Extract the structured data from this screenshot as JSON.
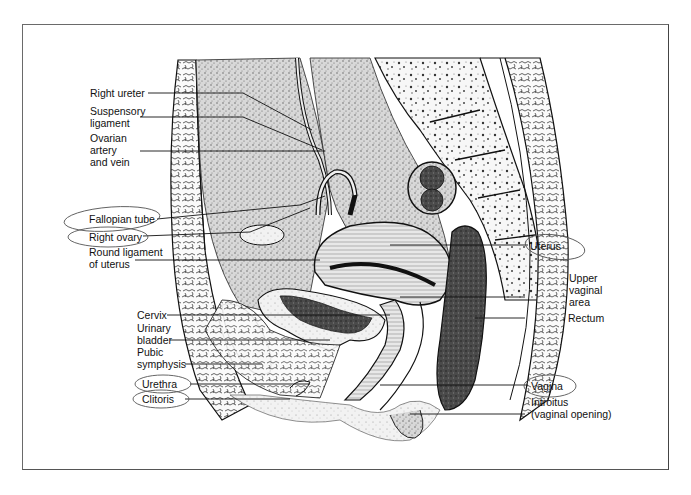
{
  "diagram": {
    "type": "anatomical sagittal section",
    "colors": {
      "ink": "#111111",
      "frame": "#6a6a6a",
      "paper": "#ffffff",
      "annotation_circle": "#555555"
    }
  },
  "labels_left": [
    {
      "id": "right-ureter",
      "lines": [
        "Right ureter"
      ],
      "circled": false
    },
    {
      "id": "suspensory-ligament",
      "lines": [
        "Suspensory",
        "ligament"
      ],
      "circled": false
    },
    {
      "id": "ovarian-artery-vein",
      "lines": [
        "Ovarian",
        "artery",
        "and vein"
      ],
      "circled": false
    },
    {
      "id": "fallopian-tube",
      "lines": [
        "Fallopian tube"
      ],
      "circled": true
    },
    {
      "id": "right-ovary",
      "lines": [
        "Right ovary"
      ],
      "circled": true
    },
    {
      "id": "round-ligament",
      "lines": [
        "Round ligament",
        "of uterus"
      ],
      "circled": false
    },
    {
      "id": "cervix",
      "lines": [
        "Cervix"
      ],
      "circled": false
    },
    {
      "id": "urinary-bladder",
      "lines": [
        "Urinary",
        "bladder"
      ],
      "circled": false
    },
    {
      "id": "pubic-symphysis",
      "lines": [
        "Pubic",
        "symphysis"
      ],
      "circled": false
    },
    {
      "id": "urethra",
      "lines": [
        "Urethra"
      ],
      "circled": true
    },
    {
      "id": "clitoris",
      "lines": [
        "Clitoris"
      ],
      "circled": true
    }
  ],
  "labels_right": [
    {
      "id": "uterus",
      "lines": [
        "Uterus"
      ],
      "circled": true
    },
    {
      "id": "upper-vaginal-area",
      "lines": [
        "Upper",
        "vaginal",
        "area"
      ],
      "circled": false
    },
    {
      "id": "rectum",
      "lines": [
        "Rectum"
      ],
      "circled": false
    },
    {
      "id": "vagina",
      "lines": [
        "Vagina"
      ],
      "circled": true
    },
    {
      "id": "introitus",
      "lines": [
        "Introitus",
        "(vaginal opening)"
      ],
      "circled": false
    }
  ]
}
